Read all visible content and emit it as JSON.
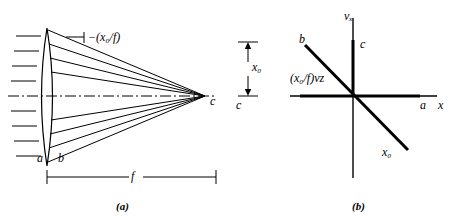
{
  "figure": {
    "title_caption_a": "(a)",
    "title_caption_b": "(b)"
  },
  "panel_a": {
    "name": "converging-lens-ray-diagram",
    "slope_label": "−(x₀/f)",
    "lens_front_label": "a",
    "lens_back_label": "b",
    "focal_point_label": "c",
    "focal_length_label": "f",
    "ray_count": 9,
    "optical_axis_style": "dash-dot"
  },
  "panel_b": {
    "name": "phase-space-diagram",
    "y_axis_label": "vₓ",
    "x_axis_label": "x",
    "x_axis_point_label": "a",
    "y_axis_point_label": "c",
    "line_label": "(x₀/f)vᴢ",
    "lower_right_label": "x₀",
    "upper_left_point_label": "b"
  },
  "dimension": {
    "x0_label": "x₀",
    "x0_point_label": "c"
  },
  "colors": {
    "ink": "#000000",
    "paper": "#ffffff"
  }
}
